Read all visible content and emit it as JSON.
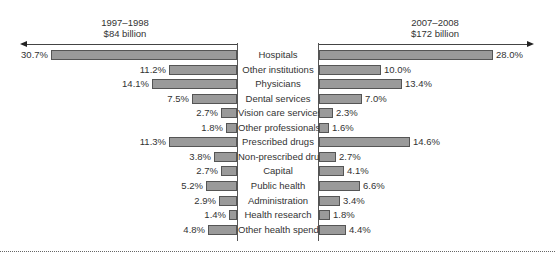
{
  "chart_data": {
    "type": "bar",
    "orientation": "horizontal-diverging",
    "title": "",
    "xlabel": "",
    "ylabel": "",
    "legend": [],
    "categories": [
      "Hospitals",
      "Other institutions",
      "Physicians",
      "Dental services",
      "Vision care services",
      "Other professionals",
      "Prescribed drugs",
      "Non-prescribed drugs",
      "Capital",
      "Public health",
      "Administration",
      "Health research",
      "Other health spending"
    ],
    "series": [
      {
        "name": "1997–1998",
        "subtitle": "$84 billion",
        "side": "left",
        "values": [
          30.7,
          11.2,
          14.1,
          7.5,
          2.7,
          1.8,
          11.3,
          3.8,
          2.7,
          5.2,
          2.9,
          1.4,
          4.8
        ],
        "labels": [
          "30.7%",
          "11.2%",
          "14.1%",
          "7.5%",
          "2.7%",
          "1.8%",
          "11.3%",
          "3.8%",
          "2.7%",
          "5.2%",
          "2.9%",
          "1.4%",
          "4.8%"
        ]
      },
      {
        "name": "2007–2008",
        "subtitle": "$172 billion",
        "side": "right",
        "values": [
          28.0,
          10.0,
          13.4,
          7.0,
          2.3,
          1.6,
          14.6,
          2.7,
          4.1,
          6.6,
          3.4,
          1.8,
          4.4
        ],
        "labels": [
          "28.0%",
          "10.0%",
          "13.4%",
          "7.0%",
          "2.3%",
          "1.6%",
          "14.6%",
          "2.7%",
          "4.1%",
          "6.6%",
          "3.4%",
          "1.8%",
          "4.4%"
        ]
      }
    ],
    "unit": "%",
    "grid": false,
    "bar_color": "#9a9a9a"
  },
  "headers": {
    "left_period": "1997–1998",
    "left_total": "$84 billion",
    "right_period": "2007–2008",
    "right_total": "$172 billion"
  }
}
